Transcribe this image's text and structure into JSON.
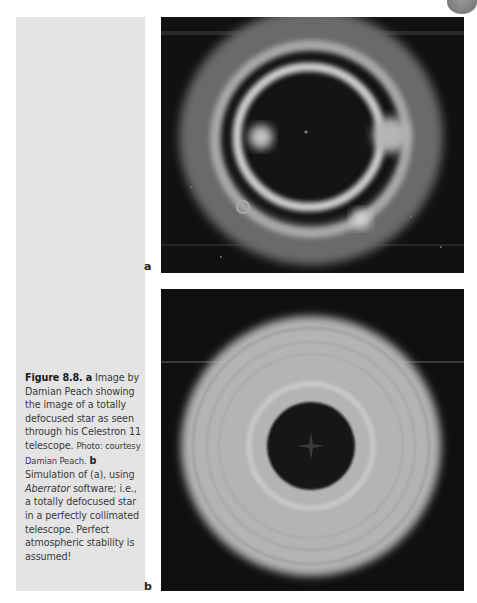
{
  "figure": {
    "number": "Figure 8.8.",
    "panel_a_letter": "a",
    "panel_a_text": "Image by Damian Peach showing the image of a totally defocused star as seen through his Celestron 11 telescope.",
    "panel_a_credit": "Photo: courtesy Damian Peach.",
    "panel_b_letter": "b",
    "panel_b_text_1": "Simulation of (a), using",
    "panel_b_software": "Aberrator",
    "panel_b_text_2": "software; i.e., a totally defocused star in a perfectly collimated telescope. Perfect atmospheric stability is assumed!"
  },
  "panels": {
    "a": {
      "label": "a",
      "description": "Photograph of a defocused star: bright irregular ring on black background"
    },
    "b": {
      "label": "b",
      "description": "Simulated defocused star: smooth concentric gray rings with dark center"
    }
  },
  "colors": {
    "sidebar": "#e4e4e4",
    "panel_bg": "#0f0f0f",
    "ring": "#bdbdbd"
  }
}
